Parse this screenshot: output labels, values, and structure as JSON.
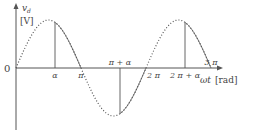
{
  "chart_data": {
    "type": "line",
    "title": "",
    "ylabel_var": "v",
    "ylabel_sub": "d",
    "ylabel_unit": "[V]",
    "xlabel_var": "ωt",
    "xlabel_unit": "[rad]",
    "origin_label": "0",
    "alpha_fraction_of_pi": 0.6,
    "xlim_pi": [
      0,
      3.15
    ],
    "ylim": [
      -1,
      1
    ],
    "series": [
      {
        "name": "sin(ωt) full wave",
        "style": "dotted",
        "x_pi": [
          0,
          3
        ],
        "function": "sin"
      },
      {
        "name": "controlled output v_d",
        "style": "solid",
        "segments_pi": [
          [
            0.6,
            1.0
          ],
          [
            1.6,
            2.0
          ],
          [
            2.6,
            3.0
          ]
        ]
      }
    ],
    "tick_labels": [
      {
        "label": "α",
        "pos": "alpha",
        "side": "below"
      },
      {
        "label": "π",
        "pos": "pi",
        "side": "below"
      },
      {
        "label": "π + α",
        "pos": "pi_alpha",
        "side": "above"
      },
      {
        "label": "2 π",
        "pos": "two_pi",
        "side": "below"
      },
      {
        "label": "2 π + α",
        "pos": "two_pi_alpha",
        "side": "below"
      },
      {
        "label": "3 π",
        "pos": "three_pi",
        "side": "above"
      }
    ],
    "colors": {
      "axis": "#555555",
      "curve": "#555555",
      "text": "#444444"
    }
  }
}
